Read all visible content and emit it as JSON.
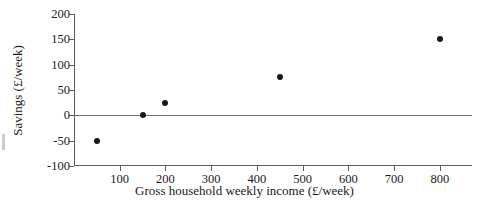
{
  "chart_data": {
    "type": "scatter",
    "title": "",
    "xlabel": "Gross household weekly income (£/week)",
    "ylabel": "Savings (£/week)",
    "x": [
      50,
      150,
      200,
      450,
      800
    ],
    "y": [
      -50,
      0,
      25,
      75,
      150
    ],
    "points": [
      {
        "x": 50,
        "y": -50
      },
      {
        "x": 150,
        "y": 0
      },
      {
        "x": 200,
        "y": 25
      },
      {
        "x": 450,
        "y": 75
      },
      {
        "x": 800,
        "y": 150
      }
    ],
    "xlim": [
      0,
      870
    ],
    "ylim": [
      -100,
      200
    ],
    "xticks": [
      100,
      200,
      300,
      400,
      500,
      600,
      700,
      800
    ],
    "yticks": [
      -100,
      -50,
      0,
      50,
      100,
      150,
      200
    ],
    "xtick_labels": [
      "100",
      "200",
      "300",
      "400",
      "500",
      "600",
      "700",
      "800"
    ],
    "ytick_labels": [
      "-100",
      "-50",
      "0",
      "50",
      "100",
      "150",
      "200"
    ],
    "grid": false,
    "legend": null,
    "reference_lines": [
      {
        "axis": "y",
        "value": 0
      }
    ],
    "marker_color": "#181818",
    "axis_color": "#5c5c5c"
  }
}
